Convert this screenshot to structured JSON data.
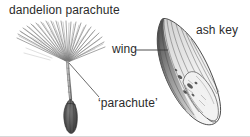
{
  "figure": {
    "kind": "botanical-diagram",
    "background_color": "#ffffff",
    "ink_color": "#2b2b2b",
    "width": 250,
    "height": 137
  },
  "labels": {
    "dandelion_parachute": "dandelion parachute",
    "ash_key": "ash key",
    "wing": "wing",
    "parachute": "‘parachute’"
  },
  "specimens": [
    {
      "name": "dandelion-parachute",
      "parts": [
        "pappus hairs",
        "beak",
        "achene"
      ],
      "shading": "fine grey hatching"
    },
    {
      "name": "ash-key",
      "parts": [
        "wing",
        "seed body"
      ],
      "shading": "dark striations at tip, pale mottled body"
    }
  ],
  "leader_lines": [
    {
      "name": "wing-leader",
      "from": "wing label",
      "to": "ash key wing edge"
    },
    {
      "name": "parachute-leader",
      "from": "parachute label",
      "to": "pappus centre"
    }
  ]
}
